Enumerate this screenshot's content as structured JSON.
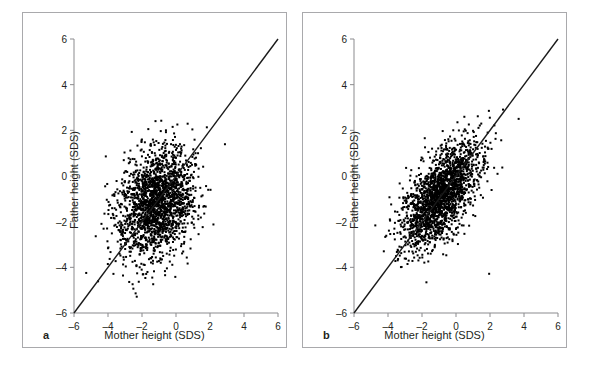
{
  "figure": {
    "panels": [
      {
        "tag": "a",
        "xlabel": "Mother height (SDS)",
        "ylabel": "Father height (SDS)"
      },
      {
        "tag": "b",
        "xlabel": "Mother height (SDS)",
        "ylabel": "Father height (SDS)"
      }
    ],
    "colors": {
      "point": "#000000",
      "axis": "#8b8b8e",
      "border": "#a9a9ac",
      "text": "#231f20",
      "line": "#1a1a1a",
      "background": "#ffffff"
    }
  },
  "chart_data": [
    {
      "type": "scatter",
      "panel": "a",
      "title": "",
      "xlabel": "Mother height (SDS)",
      "ylabel": "Father height (SDS)",
      "xlim": [
        -6,
        6
      ],
      "ylim": [
        -6,
        6
      ],
      "xticks": [
        -6,
        -4,
        -2,
        0,
        2,
        4,
        6
      ],
      "yticks": [
        -6,
        -4,
        -2,
        0,
        2,
        4,
        6
      ],
      "xticklabels": [
        "-6",
        "-4",
        "-2",
        "0",
        "2",
        "4",
        "6"
      ],
      "yticklabels": [
        "-6",
        "-4",
        "-2",
        "0",
        "2",
        "4",
        "6"
      ],
      "grid": false,
      "legend": null,
      "n_points": 2000,
      "marker": "square",
      "marker_size_px": 2,
      "distribution": {
        "mean_x": -1.1,
        "mean_y": -1.2,
        "sd_x": 1.15,
        "sd_y": 1.2,
        "correlation": 0.25
      },
      "reference_line": {
        "type": "identity",
        "label": "y = x",
        "from": [
          -6,
          -6
        ],
        "to": [
          6,
          6
        ]
      }
    },
    {
      "type": "scatter",
      "panel": "b",
      "title": "",
      "xlabel": "Mother height (SDS)",
      "ylabel": "Father height (SDS)",
      "xlim": [
        -6,
        6
      ],
      "ylim": [
        -6,
        6
      ],
      "xticks": [
        -6,
        -4,
        -2,
        0,
        2,
        4,
        6
      ],
      "yticks": [
        -6,
        -4,
        -2,
        0,
        2,
        4,
        6
      ],
      "xticklabels": [
        "-6",
        "-4",
        "-2",
        "0",
        "2",
        "4",
        "6"
      ],
      "yticklabels": [
        "-6",
        "-4",
        "-2",
        "0",
        "2",
        "4",
        "6"
      ],
      "grid": false,
      "legend": null,
      "n_points": 2000,
      "marker": "square",
      "marker_size_px": 2,
      "distribution": {
        "mean_x": -0.9,
        "mean_y": -0.85,
        "sd_x": 1.15,
        "sd_y": 1.15,
        "correlation": 0.62
      },
      "reference_line": {
        "type": "identity",
        "label": "y = x",
        "from": [
          -6,
          -6
        ],
        "to": [
          6,
          6
        ]
      }
    }
  ]
}
